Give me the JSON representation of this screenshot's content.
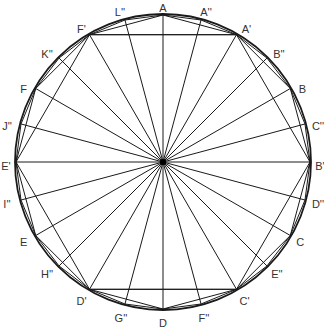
{
  "diagram": {
    "title": "",
    "center": {
      "x": 163,
      "y": 162
    },
    "radius": 147,
    "circle_radius": 148,
    "stroke_color": "#1a1a1a",
    "label_color": "#333333",
    "points": [
      {
        "name": "A",
        "angle": 90,
        "label_dx": 0,
        "label_dy": -7
      },
      {
        "name": "A''",
        "angle": 75,
        "label_dx": 5,
        "label_dy": -8
      },
      {
        "name": "A'",
        "angle": 60,
        "label_dx": 10,
        "label_dy": -6
      },
      {
        "name": "B''",
        "angle": 45,
        "label_dx": 12,
        "label_dy": -4
      },
      {
        "name": "B",
        "angle": 30,
        "label_dx": 12,
        "label_dy": 0
      },
      {
        "name": "C''",
        "angle": 15,
        "label_dx": 13,
        "label_dy": 2
      },
      {
        "name": "B'",
        "angle": 0,
        "label_dx": 10,
        "label_dy": 4
      },
      {
        "name": "D''",
        "angle": -15,
        "label_dx": 13,
        "label_dy": 4
      },
      {
        "name": "C",
        "angle": -30,
        "label_dx": 10,
        "label_dy": 6
      },
      {
        "name": "E''",
        "angle": -45,
        "label_dx": 10,
        "label_dy": 8
      },
      {
        "name": "C'",
        "angle": -60,
        "label_dx": 8,
        "label_dy": 12
      },
      {
        "name": "F''",
        "angle": -75,
        "label_dx": 3,
        "label_dy": 14
      },
      {
        "name": "D",
        "angle": -90,
        "label_dx": 0,
        "label_dy": 14
      },
      {
        "name": "G''",
        "angle": -105,
        "label_dx": -4,
        "label_dy": 14
      },
      {
        "name": "D'",
        "angle": -120,
        "label_dx": -8,
        "label_dy": 12
      },
      {
        "name": "H''",
        "angle": -135,
        "label_dx": -12,
        "label_dy": 8
      },
      {
        "name": "E",
        "angle": -150,
        "label_dx": -12,
        "label_dy": 6
      },
      {
        "name": "I''",
        "angle": -165,
        "label_dx": -14,
        "label_dy": 4
      },
      {
        "name": "E'",
        "angle": 180,
        "label_dx": -10,
        "label_dy": 4
      },
      {
        "name": "J''",
        "angle": 165,
        "label_dx": -14,
        "label_dy": 2
      },
      {
        "name": "F",
        "angle": 150,
        "label_dx": -12,
        "label_dy": 0
      },
      {
        "name": "K''",
        "angle": 135,
        "label_dx": -12,
        "label_dy": -4
      },
      {
        "name": "F'",
        "angle": 120,
        "label_dx": -8,
        "label_dy": -6
      },
      {
        "name": "L''",
        "angle": 105,
        "label_dx": -5,
        "label_dy": -8
      }
    ],
    "polygons": {
      "hexagon": [
        "A'",
        "B'",
        "C'",
        "D'",
        "E'",
        "F'"
      ],
      "dodecagon": [
        "A",
        "A'",
        "B",
        "B'",
        "C",
        "C'",
        "D",
        "D'",
        "E",
        "E'",
        "F",
        "F'"
      ],
      "icositetragon": [
        "A",
        "A''",
        "A'",
        "B''",
        "B",
        "C''",
        "B'",
        "D''",
        "C",
        "E''",
        "C'",
        "F''",
        "D",
        "G''",
        "D'",
        "H''",
        "E",
        "I''",
        "E'",
        "J''",
        "F",
        "K''",
        "F'",
        "L''"
      ]
    },
    "chords": [
      [
        "F'",
        "A'"
      ],
      [
        "D'",
        "C'"
      ]
    ]
  }
}
